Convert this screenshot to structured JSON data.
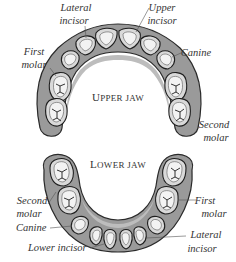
{
  "diagram": {
    "upper_jaw": {
      "title_initial": "U",
      "title_rest": "PPER JAW",
      "labels": {
        "lateral_incisor": [
          "Lateral",
          "incisor"
        ],
        "upper_incisor": [
          "Upper",
          "incisor"
        ],
        "first_molar": [
          "First",
          "molar"
        ],
        "canine": [
          "Canine"
        ],
        "second_molar": [
          "Second",
          "molar"
        ]
      }
    },
    "lower_jaw": {
      "title_initial": "L",
      "title_rest": "OWER JAW",
      "labels": {
        "second_molar": [
          "Second",
          "molar"
        ],
        "first_molar": [
          "First",
          "molar"
        ],
        "canine": [
          "Canine"
        ],
        "lower_incisor": [
          "Lower incisor"
        ],
        "lateral_incisor": [
          "Lateral",
          "incisor"
        ]
      }
    },
    "colors": {
      "gum": "#9a9a9a",
      "tooth": "#d9d9d9",
      "crown": "#f3f3f3",
      "outline": "#1e1e1e",
      "text": "#333333"
    }
  }
}
